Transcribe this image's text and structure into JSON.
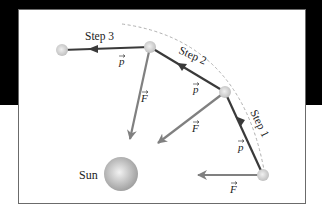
{
  "figure": {
    "labels": {
      "step1": "Step 1",
      "step2": "Step 2",
      "step3": "Step 3",
      "sun": "Sun",
      "momentum": "p",
      "force": "F"
    },
    "colors": {
      "background_top": "#000000",
      "background_bottom": "#ffffff",
      "frame_border": "#6b6b6b",
      "momentum_arrow": "#3a3a3a",
      "force_arrow": "#808080",
      "orbit_dashed": "#b0b0b0",
      "planet": "#c8c8c8",
      "sun": "#a9a9a9"
    },
    "elements": {
      "planet_positions": [
        "start",
        "after step 1",
        "after step 2",
        "after step 3"
      ],
      "momentum_vectors": 3,
      "force_vectors": 3
    }
  }
}
